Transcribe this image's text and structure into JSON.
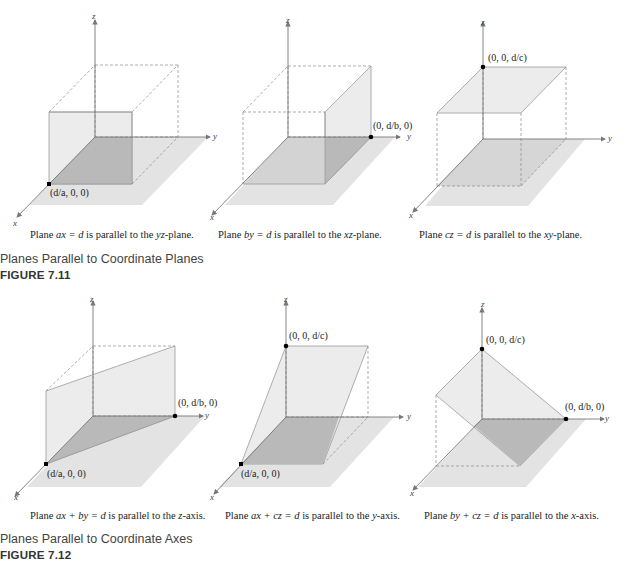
{
  "figure_7_11": {
    "title": "Planes Parallel to Coordinate Planes",
    "number": "FIGURE 7.11",
    "panels": [
      {
        "caption_pre": "Plane ",
        "equation": "ax = d",
        "caption_mid": " is parallel to the ",
        "target": "yz",
        "caption_post": "-plane.",
        "point_label": "(d/a, 0, 0)"
      },
      {
        "caption_pre": "Plane ",
        "equation": "by = d",
        "caption_mid": " is parallel to the ",
        "target": "xz",
        "caption_post": "-plane.",
        "point_label": "(0, d/b, 0)"
      },
      {
        "caption_pre": "Plane ",
        "equation": "cz = d",
        "caption_mid": " is parallel to the ",
        "target": "xy",
        "caption_post": "-plane.",
        "point_label": "(0, 0, d/c)"
      }
    ]
  },
  "figure_7_12": {
    "title": "Planes Parallel to Coordinate Axes",
    "number": "FIGURE 7.12",
    "panels": [
      {
        "caption_pre": "Plane ",
        "equation": "ax + by = d",
        "caption_mid": " is parallel to the ",
        "target": "z",
        "caption_post": "-axis.",
        "point_labels": [
          "(d/a, 0, 0)",
          "(0, d/b, 0)"
        ]
      },
      {
        "caption_pre": "Plane ",
        "equation": "ax + cz = d",
        "caption_mid": " is parallel to the ",
        "target": "y",
        "caption_post": "-axis.",
        "point_labels": [
          "(0, 0, d/c)",
          "(d/a, 0, 0)"
        ]
      },
      {
        "caption_pre": "Plane ",
        "equation": "by + cz = d",
        "caption_mid": " is parallel to the ",
        "target": "x",
        "caption_post": "-axis.",
        "point_labels": [
          "(0, 0, d/c)",
          "(0, d/b, 0)"
        ]
      }
    ]
  },
  "axes": {
    "x": "x",
    "y": "y",
    "z": "z"
  },
  "colors": {
    "floor": "#e3e3e3",
    "plane": "#ececec",
    "shadow": "#b9b9b9",
    "axis": "#777777",
    "edge": "#9a9a9a",
    "dashed": "#8a8a8a",
    "point": "#000000"
  }
}
